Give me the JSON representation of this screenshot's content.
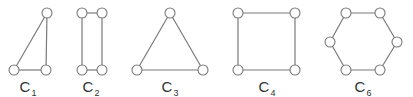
{
  "colors": {
    "stroke": "#7a7a7a",
    "node_fill": "#ffffff",
    "text": "#333333"
  },
  "graphs": [
    {
      "name": "C",
      "sub": "1",
      "label_x": 28,
      "nodes": [
        [
          47,
          13
        ],
        [
          14,
          70
        ],
        [
          46,
          70
        ]
      ],
      "edges": [
        [
          0,
          1
        ],
        [
          1,
          2
        ],
        [
          2,
          0
        ]
      ]
    },
    {
      "name": "C",
      "sub": "2",
      "label_x": 91,
      "nodes": [
        [
          82,
          13
        ],
        [
          102,
          13
        ],
        [
          102,
          70
        ],
        [
          82,
          70
        ]
      ],
      "edges": [
        [
          0,
          1
        ],
        [
          1,
          2
        ],
        [
          2,
          3
        ],
        [
          3,
          0
        ]
      ]
    },
    {
      "name": "C",
      "sub": "3",
      "label_x": 170,
      "nodes": [
        [
          170,
          13
        ],
        [
          203,
          70
        ],
        [
          137,
          70
        ]
      ],
      "edges": [
        [
          0,
          1
        ],
        [
          1,
          2
        ],
        [
          2,
          0
        ]
      ]
    },
    {
      "name": "C",
      "sub": "4",
      "label_x": 267,
      "nodes": [
        [
          238,
          13
        ],
        [
          295,
          13
        ],
        [
          295,
          70
        ],
        [
          238,
          70
        ]
      ],
      "edges": [
        [
          0,
          1
        ],
        [
          1,
          2
        ],
        [
          2,
          3
        ],
        [
          3,
          0
        ]
      ]
    },
    {
      "name": "C",
      "sub": "6",
      "label_x": 363,
      "nodes": [
        [
          346,
          13
        ],
        [
          380,
          13
        ],
        [
          397,
          42
        ],
        [
          380,
          70
        ],
        [
          346,
          70
        ],
        [
          330,
          42
        ]
      ],
      "edges": [
        [
          0,
          1
        ],
        [
          1,
          2
        ],
        [
          2,
          3
        ],
        [
          3,
          4
        ],
        [
          4,
          5
        ],
        [
          5,
          0
        ]
      ]
    }
  ]
}
